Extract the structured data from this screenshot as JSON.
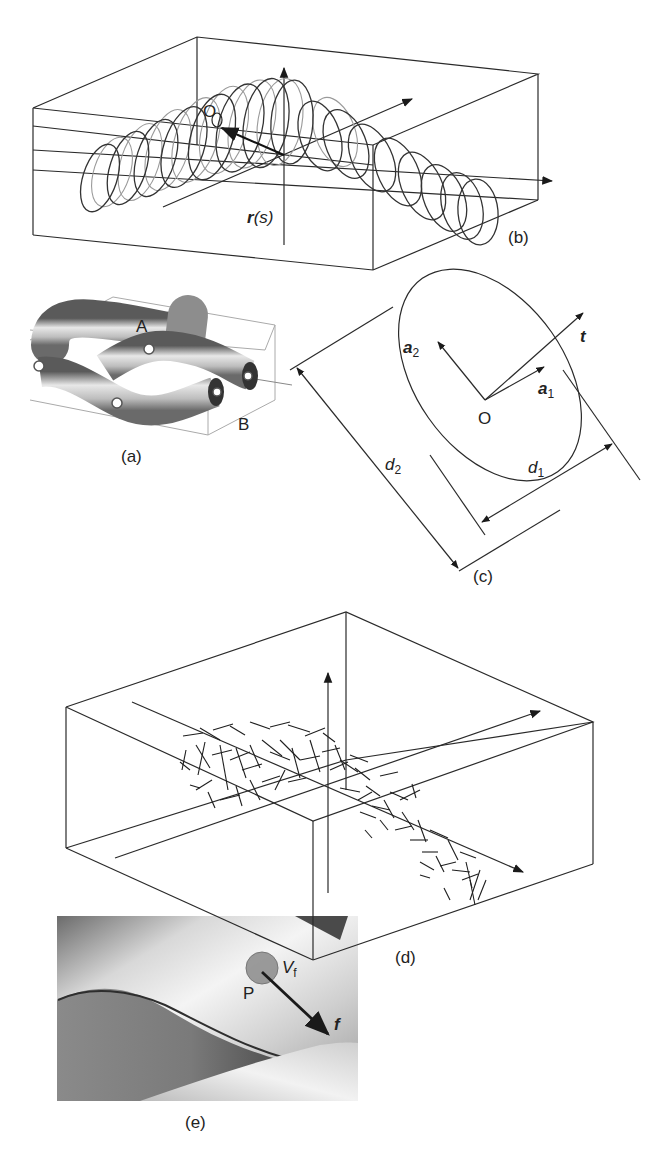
{
  "figure": {
    "panels": {
      "a": {
        "caption": "(a)",
        "point_labels": [
          "A",
          "B"
        ]
      },
      "b": {
        "caption": "(b)",
        "origin_label": "O",
        "vector_label_bold": "r",
        "vector_label_arg": "(s)"
      },
      "c": {
        "caption": "(c)",
        "origin_label": "O",
        "axis_a2": {
          "bold": "a",
          "sub": "2"
        },
        "axis_a1": {
          "bold": "a",
          "sub": "1"
        },
        "tangent": "t",
        "dim_d2": {
          "italic": "d",
          "sub": "2"
        },
        "dim_d1": {
          "italic": "d",
          "sub": "1"
        }
      },
      "d": {
        "caption": "(d)"
      },
      "e": {
        "caption": "(e)",
        "point_label": "P",
        "volume_label": {
          "italic": "V",
          "sub": "f"
        },
        "force_label": "f"
      }
    },
    "colors": {
      "line": "#2a2a2a",
      "back_coil": "#9a9a9a",
      "marker_fill": "#8a8a8a",
      "background": "#ffffff"
    }
  }
}
